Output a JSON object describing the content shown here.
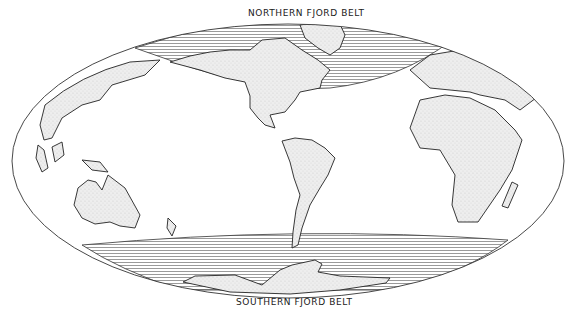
{
  "map": {
    "projection": "world equal-area oval",
    "belts": [
      {
        "id": "north",
        "label": "NORTHERN FJORD BELT"
      },
      {
        "id": "south",
        "label": "SOUTHERN FJORD BELT"
      }
    ],
    "colors": {
      "outline": "#333333",
      "land_fill": "#e9e9e9",
      "hatch": "#555555",
      "background": "#ffffff"
    },
    "legend": {
      "hatched_area": "fjord belt",
      "stippled_area": "land"
    }
  }
}
